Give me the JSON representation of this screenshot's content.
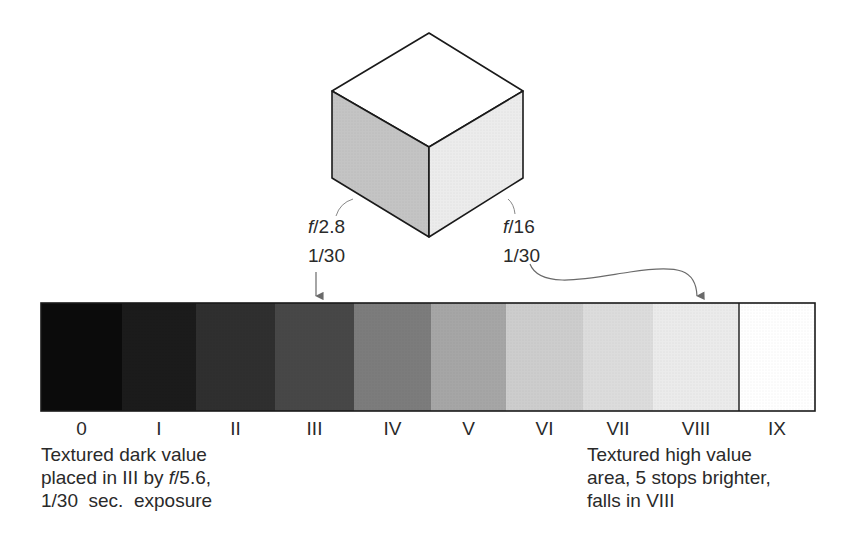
{
  "cube": {
    "top_face_color": "#ffffff",
    "left_face_color": "#c4c4c4",
    "right_face_color": "#ececec",
    "edge_color": "#1a1a1a"
  },
  "labels": {
    "left": {
      "aperture_prefix": "f",
      "aperture_value": "/2.8",
      "shutter": "1/30"
    },
    "right": {
      "aperture_prefix": "f",
      "aperture_value": "/16",
      "shutter": "1/30"
    }
  },
  "zone_scale": {
    "zones": [
      {
        "label": "0",
        "color": "#0b0b0b"
      },
      {
        "label": "I",
        "color": "#1b1b1b"
      },
      {
        "label": "II",
        "color": "#2f2f2f"
      },
      {
        "label": "III",
        "color": "#474747"
      },
      {
        "label": "IV",
        "color": "#7c7c7c"
      },
      {
        "label": "V",
        "color": "#a6a6a6"
      },
      {
        "label": "VI",
        "color": "#cdcdcd"
      },
      {
        "label": "VII",
        "color": "#dcdcdc"
      },
      {
        "label": "VIII",
        "color": "#ebebeb"
      },
      {
        "label": "IX",
        "color": "#ffffff"
      }
    ]
  },
  "captions": {
    "left": {
      "line1": "Textured dark value",
      "line2_pre": "placed in III by ",
      "line2_italic": "f",
      "line2_post": "/5.6,",
      "line3": "1/30  sec.  exposure"
    },
    "right": {
      "line1": "Textured high value",
      "line2": "area, 5 stops brighter,",
      "line3": "falls in VIII"
    }
  }
}
